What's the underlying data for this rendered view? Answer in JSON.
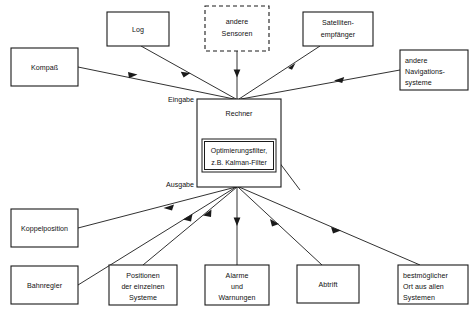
{
  "diagram": {
    "type": "block-flow-diagram",
    "language": "de",
    "colors": {
      "stroke": "#1a1a1a",
      "background": "#ffffff",
      "text": "#111111"
    },
    "center": {
      "title": "Rechner",
      "ports": {
        "input_label": "Eingabe",
        "output_label": "Ausgabe"
      },
      "filter": {
        "line1": "Optimierungsfilter,",
        "line2": "z.B. Kalman-Filter"
      }
    },
    "inputs": [
      {
        "id": "kompass",
        "lines": [
          "Kompaß"
        ],
        "align": "center",
        "dashed": false
      },
      {
        "id": "log",
        "lines": [
          "Log"
        ],
        "align": "center",
        "dashed": false
      },
      {
        "id": "sensoren",
        "lines": [
          "andere",
          "Sensoren"
        ],
        "align": "center",
        "dashed": true
      },
      {
        "id": "satellit",
        "lines": [
          "Satelliten-",
          "empfänger"
        ],
        "align": "center",
        "dashed": false
      },
      {
        "id": "navsysteme",
        "lines": [
          "andere",
          "Navigations-",
          "systeme"
        ],
        "align": "left",
        "dashed": false
      }
    ],
    "outputs": [
      {
        "id": "koppelposition",
        "lines": [
          "Koppelposition"
        ],
        "align": "center"
      },
      {
        "id": "bahnregler",
        "lines": [
          "Bahnregler"
        ],
        "align": "center"
      },
      {
        "id": "positionen",
        "lines": [
          "Positionen",
          "der einzelnen",
          "Systeme"
        ],
        "align": "center"
      },
      {
        "id": "alarme",
        "lines": [
          "Alarme",
          "und",
          "Warnungen"
        ],
        "align": "center"
      },
      {
        "id": "abtrift",
        "lines": [
          "Abtrift"
        ],
        "align": "center"
      },
      {
        "id": "bestmoeglich",
        "lines": [
          "bestmöglicher",
          "Ort aus allen",
          "Systemen"
        ],
        "align": "left"
      }
    ]
  }
}
